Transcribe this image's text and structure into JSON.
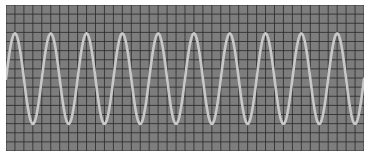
{
  "display": {
    "background_color": "#7d7d7d",
    "grid_color": "#2e2e2e",
    "trace_color": "#c8c8c8",
    "grid_cols": 40,
    "grid_rows": 16,
    "major_every": 1
  },
  "waveform": {
    "type": "sine",
    "cycles": 10,
    "amplitude_fraction": 0.31,
    "center_fraction": 0.505,
    "phase_deg": 0
  }
}
